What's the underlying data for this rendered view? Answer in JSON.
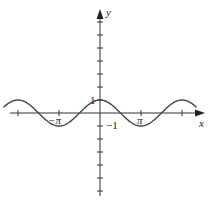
{
  "chart_data": {
    "type": "line",
    "title": "",
    "function": "y = cos(x)",
    "xlabel": "x",
    "ylabel": "y",
    "xlim": [
      -6.9,
      7.0
    ],
    "ylim": [
      -6.6,
      7.9
    ],
    "x_ticks": [
      -6.283,
      -3.1416,
      3.1416,
      6.283
    ],
    "x_tick_labels": [
      "",
      "−π",
      "π",
      ""
    ],
    "y_ticks": [
      -6,
      -5,
      -4,
      -3,
      -2,
      -1,
      1,
      2,
      3,
      4,
      5,
      6,
      7
    ],
    "y_tick_labels_shown": {
      "1": "1",
      "-1": "−1"
    },
    "series": [
      {
        "name": "cos x",
        "x_range": [
          -7.4,
          7.4
        ],
        "sample_points": [
          {
            "x": -6.283,
            "y": 1
          },
          {
            "x": -4.712,
            "y": 0
          },
          {
            "x": -3.1416,
            "y": -1
          },
          {
            "x": -1.5708,
            "y": 0
          },
          {
            "x": 0,
            "y": 1
          },
          {
            "x": 1.5708,
            "y": 0
          },
          {
            "x": 3.1416,
            "y": -1
          },
          {
            "x": 4.712,
            "y": 0
          },
          {
            "x": 6.283,
            "y": 1
          }
        ]
      }
    ],
    "grid": false,
    "legend": "none"
  },
  "labels": {
    "x_axis": "x",
    "y_axis": "y",
    "one": "1",
    "neg_one": "−1",
    "neg_pi": "−π",
    "pi": "π"
  },
  "colors": {
    "axis": "#333333",
    "curve": "#444444",
    "text": "#222222"
  }
}
